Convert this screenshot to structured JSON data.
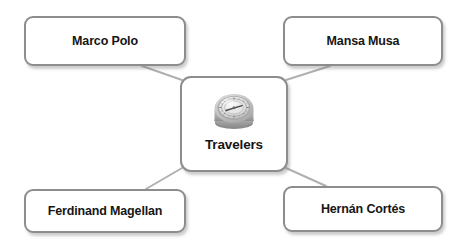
{
  "diagram": {
    "type": "hub-and-spoke concept map",
    "background_color": "#ffffff",
    "node_border_color": "#8d8d8d",
    "node_fill_color": "#ffffff",
    "connector_color": "#b0b0b0",
    "text_color": "#161616",
    "center": {
      "label": "Travelers",
      "icon": "compass-icon"
    },
    "nodes": [
      {
        "id": "top-left",
        "label": "Marco Polo"
      },
      {
        "id": "top-right",
        "label": "Mansa Musa"
      },
      {
        "id": "bottom-left",
        "label": "Ferdinand Magellan"
      },
      {
        "id": "bottom-right",
        "label": "Hernán Cortés"
      }
    ],
    "connectors": [
      {
        "from": "center",
        "to": "top-left"
      },
      {
        "from": "center",
        "to": "top-right"
      },
      {
        "from": "center",
        "to": "bottom-left"
      },
      {
        "from": "center",
        "to": "bottom-right"
      }
    ]
  }
}
